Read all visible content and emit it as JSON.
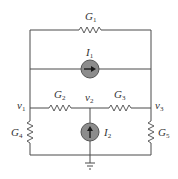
{
  "diagram": {
    "type": "circuit-schematic",
    "colors": {
      "wire": "#4a4a4a",
      "source_fill": "#8c8c8c",
      "source_stroke": "#555555",
      "arrow": "#1a1a1a",
      "text": "#333333"
    },
    "labels": {
      "g1": {
        "base": "G",
        "sub": "1"
      },
      "g2": {
        "base": "G",
        "sub": "2"
      },
      "g3": {
        "base": "G",
        "sub": "3"
      },
      "g4": {
        "base": "G",
        "sub": "4"
      },
      "g5": {
        "base": "G",
        "sub": "5"
      },
      "i1": {
        "base": "I",
        "sub": "1"
      },
      "i2": {
        "base": "I",
        "sub": "2"
      },
      "v1": {
        "base": "v",
        "sub": "1"
      },
      "v2": {
        "base": "v",
        "sub": "2"
      },
      "v3": {
        "base": "v",
        "sub": "3"
      }
    },
    "components": [
      {
        "id": "G1",
        "kind": "conductance",
        "between": [
          "v1",
          "v3"
        ],
        "position": "top"
      },
      {
        "id": "I1",
        "kind": "current-source",
        "between": [
          "v1",
          "v3"
        ],
        "direction": "right"
      },
      {
        "id": "G2",
        "kind": "conductance",
        "between": [
          "v1",
          "v2"
        ]
      },
      {
        "id": "G3",
        "kind": "conductance",
        "between": [
          "v2",
          "v3"
        ]
      },
      {
        "id": "G4",
        "kind": "conductance",
        "between": [
          "v1",
          "ground"
        ]
      },
      {
        "id": "I2",
        "kind": "current-source",
        "between": [
          "ground",
          "v2"
        ],
        "direction": "up"
      },
      {
        "id": "G5",
        "kind": "conductance",
        "between": [
          "v3",
          "ground"
        ]
      }
    ],
    "nodes": [
      "v1",
      "v2",
      "v3",
      "ground"
    ]
  }
}
